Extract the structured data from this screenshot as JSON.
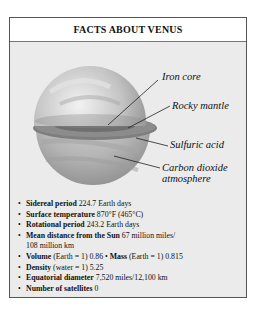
{
  "title": "FACTS ABOUT VENUS",
  "diagram": {
    "labels": {
      "iron_core": "Iron core",
      "rocky_mantle": "Rocky mantle",
      "sulfuric_acid": "Sulfuric acid",
      "carbon_dioxide_1": "Carbon dioxide",
      "carbon_dioxide_2": "atmosphere"
    }
  },
  "facts": [
    {
      "label": "Sidereal period",
      "value": " 224.7 Earth days"
    },
    {
      "label": "Surface temperature",
      "value": " 870°F (465°C)"
    },
    {
      "label": "Rotational period",
      "value": " 243.2 Earth days"
    },
    {
      "label": "Mean distance from the Sun",
      "value": " 67 million miles/",
      "value2": "108 million km"
    },
    {
      "label": "Volume",
      "value": " (Earth = 1) 0.86",
      "label2": "Mass",
      "value2": " (Earth = 1) 0.815"
    },
    {
      "label": "Density",
      "value": " (water = 1) 5.25"
    },
    {
      "label": "Equatorial diameter",
      "value": " 7,520 miles/12,100 km"
    },
    {
      "label": "Number of satellites",
      "value": " 0"
    }
  ]
}
